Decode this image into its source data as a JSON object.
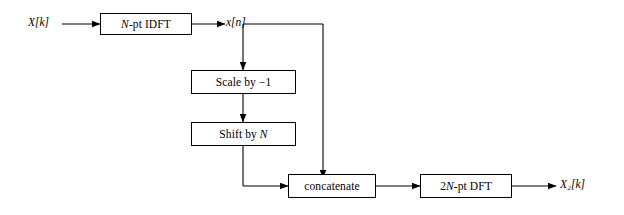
{
  "diagram": {
    "type": "block-diagram",
    "stroke_color": "#000000",
    "background_color": "#ffffff",
    "blocks": [
      {
        "id": "idft",
        "label": "N-pt IDFT",
        "label_parts": {
          "italic": "N",
          "rest": "-pt IDFT"
        }
      },
      {
        "id": "scale",
        "label": "Scale by −1"
      },
      {
        "id": "shift",
        "label": "Shift by N"
      },
      {
        "id": "concatenate",
        "label": "concatenate"
      },
      {
        "id": "dft",
        "label": "2N-pt DFT"
      }
    ],
    "signals": [
      {
        "id": "input",
        "label": "X[k]"
      },
      {
        "id": "mid",
        "label": "x[n]"
      },
      {
        "id": "output",
        "label": "X₂[k]"
      }
    ]
  }
}
